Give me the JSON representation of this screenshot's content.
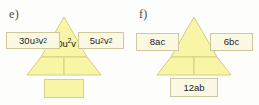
{
  "document": {
    "background_color": "#fdfdfb",
    "triangle_fill": "#f8f5a6",
    "triangle_stroke": "#d6ce82",
    "box_fill": "#fbf9e4",
    "box_stroke": "#cfc89a",
    "text_color": "#1c1c1c"
  },
  "parts": [
    {
      "id": "e",
      "label": "e)",
      "left_box": {
        "text": "30u³v²",
        "base": "30u",
        "sup1": "3",
        "mid": "v",
        "sup2": "2"
      },
      "right_box": {
        "text": "5u²v²",
        "base": "5u",
        "sup1": "2",
        "mid": "v",
        "sup2": "2"
      },
      "center_label": {
        "text": "10u²v",
        "base": "10u",
        "sup1": "2",
        "mid": "v"
      },
      "bottom_box": {
        "text": ""
      }
    },
    {
      "id": "f",
      "label": "f)",
      "left_box": {
        "text": "8ac"
      },
      "right_box": {
        "text": "6bc"
      },
      "center_label": {
        "text": ""
      },
      "bottom_box": {
        "text": "12ab"
      }
    }
  ]
}
